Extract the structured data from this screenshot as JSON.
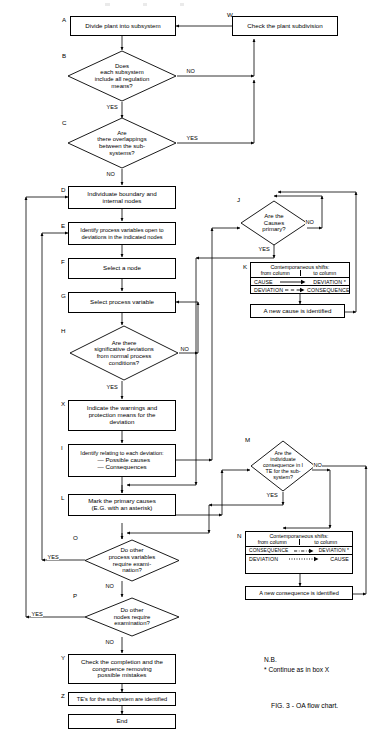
{
  "figure": {
    "caption": "FIG. 3 - OA flow chart.",
    "note_title": "N.B.",
    "note_text": "* Continue as in box X"
  },
  "nodes": {
    "A": {
      "tag": "A",
      "text": [
        "Divide plant into subsystem"
      ]
    },
    "W": {
      "tag": "W",
      "text": [
        "Check the plant subdivision"
      ]
    },
    "B": {
      "tag": "B",
      "text": [
        "Does",
        "each subsystem",
        "include all regulation",
        "means?"
      ]
    },
    "C": {
      "tag": "C",
      "text": [
        "Are",
        "there overlappings",
        "between the sub-",
        "systems?"
      ]
    },
    "D": {
      "tag": "D",
      "text": [
        "Individuate boundary and",
        "internal nodes"
      ]
    },
    "E": {
      "tag": "E",
      "text": [
        "Identify process variables open to",
        "deviations in the indicated nodes"
      ]
    },
    "F": {
      "tag": "F",
      "text": [
        "Select a node"
      ]
    },
    "G": {
      "tag": "G",
      "text": [
        "Select process variable"
      ]
    },
    "H": {
      "tag": "H",
      "text": [
        "Are there",
        "significative deviations",
        "from normal process",
        "conditions?"
      ]
    },
    "X": {
      "tag": "X",
      "text": [
        "Indicate the warnings and",
        "protection means for the",
        "deviation"
      ]
    },
    "I": {
      "tag": "I",
      "text": [
        "Identify relating to each deviation:",
        "— Possible causes",
        "— Consequences"
      ]
    },
    "L": {
      "tag": "L",
      "text": [
        "Mark the primary causes",
        "(E.G. with an asterisk)"
      ]
    },
    "O": {
      "tag": "O",
      "text": [
        "Do other",
        "process variables",
        "require exami-",
        "nation?"
      ]
    },
    "P": {
      "tag": "P",
      "text": [
        "Do other",
        "nodes require",
        "examination?"
      ]
    },
    "Y": {
      "tag": "Y",
      "text": [
        "Check the completion and the",
        "congruence removing",
        "possible mistakes"
      ]
    },
    "Z": {
      "tag": "Z",
      "text": [
        "TE's for the subsystem are identified"
      ]
    },
    "END": {
      "tag": "",
      "text": [
        "End"
      ]
    },
    "J": {
      "tag": "J",
      "text": [
        "Are the",
        "Causes",
        "primary?"
      ]
    },
    "M": {
      "tag": "M",
      "text": [
        "Are the",
        "individuate",
        "consequence in I",
        "TE for the sub-",
        "system?"
      ]
    },
    "K_result": {
      "tag": "",
      "text": [
        "A new cause is identified"
      ]
    },
    "N_result": {
      "tag": "",
      "text": [
        "A new consequence is identified"
      ]
    }
  },
  "shift_tables": {
    "K": {
      "tag": "K",
      "title": "Contemporaneous shifts:",
      "col_left": "from column",
      "col_right": "to column",
      "rows": [
        {
          "from": "CAUSE",
          "to": "DEVIATION *",
          "arrow": "solid"
        },
        {
          "from": "DEVIATION",
          "to": "CONSEQUENCE",
          "arrow": "dashed"
        }
      ]
    },
    "N": {
      "tag": "N",
      "title": "Contemporaneous shifts:",
      "col_left": "from column",
      "col_right": "to column",
      "rows": [
        {
          "from": "CONSEQUENCE",
          "to": "DEVIATION *",
          "arrow": "dashdot"
        },
        {
          "from": "DEVIATION",
          "to": "CAUSE",
          "arrow": "dotted"
        }
      ]
    }
  },
  "edge_labels": {
    "b_no": "NO",
    "b_yes": "YES",
    "c_yes": "YES",
    "c_no": "NO",
    "h_no": "NO",
    "h_yes": "YES",
    "j_no": "NO",
    "j_yes": "YES",
    "m_no": "NO",
    "m_yes": "YES",
    "o_yes": "YES",
    "o_no": "NO",
    "p_yes": "YES",
    "p_no": "NO"
  },
  "colors": {
    "line": "#000000",
    "background": "#ffffff",
    "text": "#000000"
  }
}
